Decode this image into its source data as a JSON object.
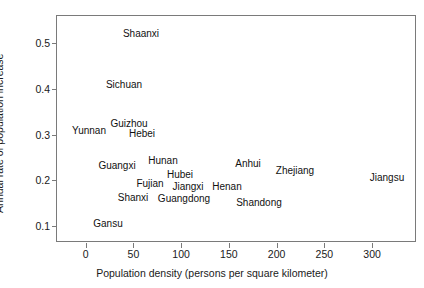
{
  "chart_data": {
    "type": "scatter",
    "title": "",
    "xlabel": "Population density (persons per square kilometer)",
    "ylabel": "Annual rate of population increase",
    "xlim": [
      -30,
      347
    ],
    "ylim": [
      0.063,
      0.56
    ],
    "xticks": [
      0,
      50,
      100,
      150,
      200,
      250,
      300
    ],
    "xticklabels": [
      "0",
      "50",
      "100",
      "150",
      "200",
      "250",
      "300"
    ],
    "yticks": [
      0.1,
      0.2,
      0.3,
      0.4,
      0.5
    ],
    "yticklabels": [
      "0.1",
      "0.2",
      "0.3",
      "0.4",
      "0.5"
    ],
    "grid": false,
    "legend": null,
    "marker_style": "text-labels-only",
    "points": [
      {
        "label": "Shaanxi",
        "x": 63,
        "y": 0.513
      },
      {
        "label": "Sichuan",
        "x": 45,
        "y": 0.387
      },
      {
        "label": "Guizhou",
        "x": 51,
        "y": 0.29
      },
      {
        "label": "Yunnan",
        "x": 9,
        "y": 0.273
      },
      {
        "label": "Hebei",
        "x": 64,
        "y": 0.265
      },
      {
        "label": "Hunan",
        "x": 86,
        "y": 0.199
      },
      {
        "label": "Guangxi",
        "x": 38,
        "y": 0.186
      },
      {
        "label": "Anhui",
        "x": 173,
        "y": 0.191
      },
      {
        "label": "Zhejiang",
        "x": 222,
        "y": 0.174
      },
      {
        "label": "Jiangsu",
        "x": 317,
        "y": 0.157
      },
      {
        "label": "Hubei",
        "x": 103,
        "y": 0.167
      },
      {
        "label": "Fujian",
        "x": 72,
        "y": 0.142
      },
      {
        "label": "Jiangxi",
        "x": 110,
        "y": 0.137
      },
      {
        "label": "Henan",
        "x": 150,
        "y": 0.135
      },
      {
        "label": "Shanxi",
        "x": 55,
        "y": 0.107
      },
      {
        "label": "Guangdong",
        "x": 107,
        "y": 0.105
      },
      {
        "label": "Shandong",
        "x": 185,
        "y": 0.095
      },
      {
        "label": "Gansu",
        "x": 29,
        "y": 0.043
      }
    ],
    "pixel_positions": {
      "note": "label centers in image pixels, for layout fidelity",
      "Shaanxi": [
        140,
        33
      ],
      "Sichuan": [
        123,
        84
      ],
      "Guizhou": [
        128,
        123
      ],
      "Yunnan": [
        88,
        130
      ],
      "Hebei": [
        141,
        133
      ],
      "Hunan": [
        162,
        160
      ],
      "Guangxi": [
        116,
        165
      ],
      "Anhui": [
        247,
        163
      ],
      "Zhejiang": [
        294,
        170
      ],
      "Jiangsu": [
        386,
        177
      ],
      "Hubei": [
        179,
        174
      ],
      "Fujian": [
        149,
        183
      ],
      "Jiangxi": [
        187,
        186
      ],
      "Henan": [
        226,
        186
      ],
      "Shanxi": [
        132,
        197
      ],
      "Guangdong": [
        183,
        198
      ],
      "Shandong": [
        258,
        202
      ],
      "Gansu": [
        107,
        223
      ]
    }
  },
  "axes": {
    "x_title": "Population density (persons per square kilometer)",
    "y_title": "Annual rate of population increase",
    "x_tick_labels": [
      "0",
      "50",
      "100",
      "150",
      "200",
      "250",
      "300"
    ],
    "y_tick_labels": [
      "0.1",
      "0.2",
      "0.3",
      "0.4",
      "0.5"
    ]
  },
  "labels": {
    "p0": "Shaanxi",
    "p1": "Sichuan",
    "p2": "Guizhou",
    "p3": "Yunnan",
    "p4": "Hebei",
    "p5": "Hunan",
    "p6": "Guangxi",
    "p7": "Anhui",
    "p8": "Zhejiang",
    "p9": "Jiangsu",
    "p10": "Hubei",
    "p11": "Fujian",
    "p12": "Jiangxi",
    "p13": "Henan",
    "p14": "Shanxi",
    "p15": "Guangdong",
    "p16": "Shandong",
    "p17": "Gansu"
  },
  "colors": {
    "background": "#ffffff",
    "axis": "#7a7a7a",
    "text": "#1a1a1a"
  }
}
